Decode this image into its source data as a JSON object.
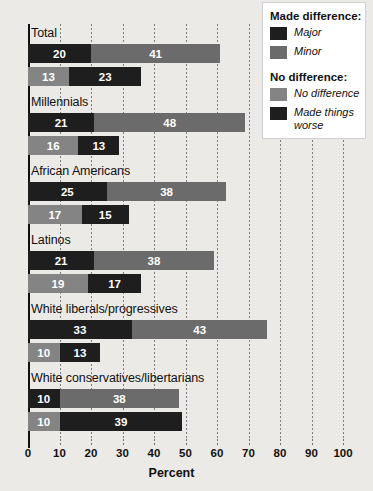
{
  "chart_data": {
    "type": "bar",
    "orientation": "horizontal",
    "stacked": true,
    "title": "",
    "xlabel": "Percent",
    "ylabel": "",
    "xlim": [
      0,
      100
    ],
    "xticks": [
      "0",
      "10",
      "20",
      "30",
      "40",
      "50",
      "60",
      "70",
      "80",
      "90",
      "100"
    ],
    "grid": true,
    "legend_position": "top-right",
    "categories": [
      "Total",
      "Millennials",
      "African Americans",
      "Latinos",
      "White liberals/progressives",
      "White conservatives/libertarians"
    ],
    "series": [
      {
        "name": "Major",
        "group": "Made difference",
        "color": "#1e1e1e",
        "values": [
          20,
          21,
          25,
          21,
          33,
          10
        ]
      },
      {
        "name": "Minor",
        "group": "Made difference",
        "color": "#6b6b6b",
        "values": [
          41,
          48,
          38,
          38,
          43,
          38
        ]
      },
      {
        "name": "No difference",
        "group": "No difference",
        "color": "#848484",
        "values": [
          13,
          16,
          17,
          19,
          10,
          10
        ]
      },
      {
        "name": "Made things worse",
        "group": "No difference",
        "color": "#1e1e1e",
        "values": [
          23,
          13,
          15,
          17,
          13,
          39
        ]
      }
    ]
  },
  "axis": {
    "x_title": "Percent",
    "ticks": [
      "0",
      "10",
      "20",
      "30",
      "40",
      "50",
      "60",
      "70",
      "80",
      "90",
      "100"
    ]
  },
  "legend": {
    "heading_made": "Made difference:",
    "heading_no": "No difference:",
    "items_made": [
      {
        "label": "Major",
        "swatch": "major"
      },
      {
        "label": "Minor",
        "swatch": "minor"
      }
    ],
    "items_no": [
      {
        "label": "No difference",
        "swatch": "nodiff"
      },
      {
        "label": "Made things worse",
        "swatch": "worse"
      }
    ]
  }
}
